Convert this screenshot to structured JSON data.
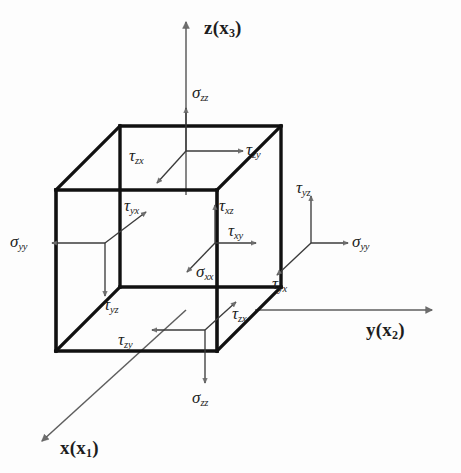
{
  "figure": {
    "kind": "stress-tensor-cube",
    "background_color": "#fdfdfd",
    "line_color": "#1d1d1d",
    "arrow_fill": "#6d6d6d",
    "cube_edge_color": "#111111"
  },
  "axes": [
    {
      "name": "z-axis",
      "symbol": "z",
      "index": "3",
      "label": "z(x3)",
      "direction": "up"
    },
    {
      "name": "y-axis",
      "symbol": "y",
      "index": "2",
      "label": "y(x2)",
      "direction": "right"
    },
    {
      "name": "x-axis",
      "symbol": "x",
      "index": "1",
      "label": "x(x1)",
      "direction": "down-left"
    }
  ],
  "faces": [
    {
      "name": "top-face",
      "normal": "+z",
      "components": [
        {
          "glyph": "σ",
          "sub": "zz",
          "type": "normal-stress",
          "direction": "up"
        },
        {
          "glyph": "τ",
          "sub": "zx",
          "type": "shear-stress",
          "direction": "down-left"
        },
        {
          "glyph": "τ",
          "sub": "zy",
          "type": "shear-stress",
          "direction": "right"
        }
      ]
    },
    {
      "name": "left-face",
      "normal": "-y",
      "components": [
        {
          "glyph": "σ",
          "sub": "yy",
          "type": "normal-stress",
          "direction": "left"
        },
        {
          "glyph": "τ",
          "sub": "yx",
          "type": "shear-stress",
          "direction": "up-right"
        },
        {
          "glyph": "τ",
          "sub": "yz",
          "type": "shear-stress",
          "direction": "down"
        }
      ]
    },
    {
      "name": "front-face",
      "normal": "-x",
      "components": [
        {
          "glyph": "τ",
          "sub": "xz",
          "type": "shear-stress",
          "direction": "up"
        },
        {
          "glyph": "τ",
          "sub": "xy",
          "type": "shear-stress",
          "direction": "right"
        },
        {
          "glyph": "σ",
          "sub": "xx",
          "type": "normal-stress",
          "direction": "down-left"
        }
      ]
    },
    {
      "name": "right-face",
      "normal": "+y",
      "components": [
        {
          "glyph": "σ",
          "sub": "yy",
          "type": "normal-stress",
          "direction": "right"
        },
        {
          "glyph": "τ",
          "sub": "yz",
          "type": "shear-stress",
          "direction": "up"
        },
        {
          "glyph": "τ",
          "sub": "yx",
          "type": "shear-stress",
          "direction": "down-left"
        }
      ]
    },
    {
      "name": "bottom-face",
      "normal": "-z",
      "components": [
        {
          "glyph": "σ",
          "sub": "zz",
          "type": "normal-stress",
          "direction": "down"
        },
        {
          "glyph": "τ",
          "sub": "zx",
          "type": "shear-stress",
          "direction": "up-right"
        },
        {
          "glyph": "τ",
          "sub": "zy",
          "type": "shear-stress",
          "direction": "left"
        }
      ]
    }
  ]
}
